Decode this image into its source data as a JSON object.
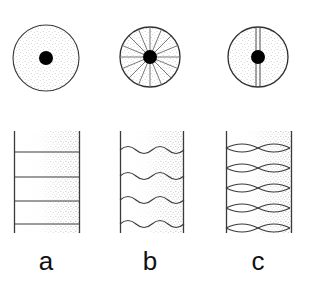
{
  "figure": {
    "type": "scientific-diagram",
    "background_color": "#ffffff",
    "stroke_color": "#3a3a3a",
    "label_color": "#111111",
    "fill_stipple_color": "#8d8d8d",
    "core_color": "#000000"
  },
  "panels": [
    {
      "id": "a",
      "label": "a",
      "label_x": 46,
      "label_y": 270,
      "cross_section": {
        "name": "plain-circle",
        "center_x": 46,
        "center_y": 58,
        "radius": 33,
        "core_radius": 7,
        "spokes": 0,
        "axial_lines": 0,
        "stipple": true
      },
      "longitudinal": {
        "name": "straight-banded-column",
        "left_x": 14,
        "right_x": 80,
        "top_y": 131,
        "bottom_y": 233,
        "line_style": "straight",
        "band_count": 4,
        "band_ys": [
          152,
          177,
          201,
          224
        ],
        "wave_cycles": 0,
        "wave_amplitude": 0,
        "gradient": "right-half-stipple"
      }
    },
    {
      "id": "b",
      "label": "b",
      "label_x": 150,
      "label_y": 270,
      "cross_section": {
        "name": "radial-spoke-circle",
        "center_x": 150,
        "center_y": 57,
        "radius": 30,
        "core_radius": 7,
        "spokes": 16,
        "axial_lines": 0,
        "stipple": true
      },
      "longitudinal": {
        "name": "wavy-banded-column",
        "left_x": 120,
        "right_x": 184,
        "top_y": 131,
        "bottom_y": 233,
        "line_style": "sinusoidal",
        "band_count": 4,
        "band_ys": [
          150,
          176,
          200,
          224
        ],
        "wave_cycles": 4,
        "wave_amplitude": 6,
        "gradient": "right-half-stipple"
      }
    },
    {
      "id": "c",
      "label": "c",
      "label_x": 258,
      "label_y": 270,
      "cross_section": {
        "name": "axial-plane-circle",
        "center_x": 258,
        "center_y": 57,
        "radius": 30,
        "core_radius": 7,
        "spokes": 0,
        "axial_lines": 2,
        "axial_line_offsets": [
          -2,
          2
        ],
        "stipple": true
      },
      "longitudinal": {
        "name": "lens-crossing-column",
        "left_x": 226,
        "right_x": 292,
        "top_y": 131,
        "bottom_y": 233,
        "line_style": "crossing-lens",
        "band_count": 5,
        "band_ys": [
          148,
          168,
          188,
          208,
          228
        ],
        "wave_cycles": 2,
        "wave_amplitude": 7,
        "gradient": "right-half-stipple"
      }
    }
  ]
}
